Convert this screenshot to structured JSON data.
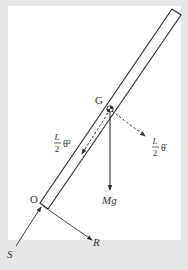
{
  "diagram": {
    "labels": {
      "center_of_mass": "G",
      "pivot": "O",
      "weight": "Mg",
      "force_s": "S",
      "force_r": "R",
      "centripetal_num": "L",
      "centripetal_den": "2",
      "centripetal_sym": "θ̇²",
      "tangential_num": "L",
      "tangential_den": "2",
      "tangential_sym": "θ̈"
    },
    "colors": {
      "background": "#e6e6e6",
      "panel": "#ffffff",
      "stroke": "#333333"
    }
  }
}
